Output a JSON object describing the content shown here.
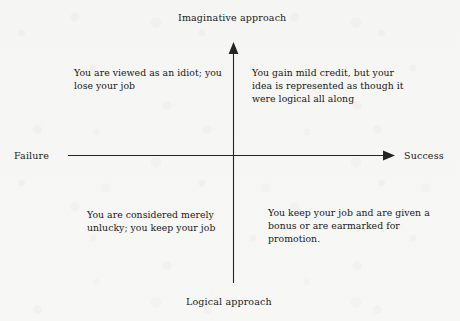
{
  "diagram": {
    "title_visible": false,
    "background_color": "#f6f6f4",
    "ink_color": "#1a1a1a",
    "axes": {
      "vertical": {
        "top_label": "Imaginative approach",
        "bottom_label": "Logical approach",
        "arrow_at": "top"
      },
      "horizontal": {
        "left_label": "Failure",
        "right_label": "Success",
        "arrow_at": "right"
      },
      "origin": {
        "x": 233,
        "y": 155
      }
    },
    "quadrants": [
      {
        "id": "upper-left",
        "position": "failure-imaginative",
        "text": "You are viewed as an idiot; you lose your job"
      },
      {
        "id": "upper-right",
        "position": "success-imaginative",
        "text": "You gain mild credit, but your idea is represented as though it were logical all along"
      },
      {
        "id": "lower-left",
        "position": "failure-logical",
        "text": "You are considered merely unlucky; you keep your job"
      },
      {
        "id": "lower-right",
        "position": "success-logical",
        "text": "You keep your job and are given a bonus or are earmarked for promotion."
      }
    ]
  }
}
